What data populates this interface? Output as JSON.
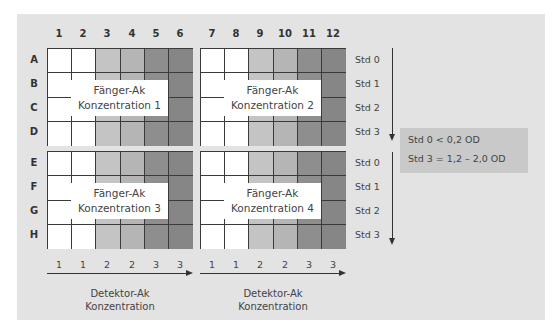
{
  "columns": [
    "1",
    "2",
    "3",
    "4",
    "5",
    "6",
    "7",
    "8",
    "9",
    "10",
    "11",
    "12"
  ],
  "rows_top": [
    "A",
    "B",
    "C",
    "D"
  ],
  "rows_bottom": [
    "E",
    "F",
    "G",
    "H"
  ],
  "colors": {
    "white": "#ffffff",
    "light": "#c4c4c4",
    "mid": "#b5b5b5",
    "dark": "#8e8e8e",
    "darker": "#868686",
    "panel": "#e3e3e3",
    "note": "#c9c9c9"
  },
  "plates": [
    {
      "title1": "Fänger-Ak",
      "title2": "Konzentration 1"
    },
    {
      "title1": "Fänger-Ak",
      "title2": "Konzentration 2"
    },
    {
      "title1": "Fänger-Ak",
      "title2": "Konzentration 3"
    },
    {
      "title1": "Fänger-Ak",
      "title2": "Konzentration 4"
    }
  ],
  "standards": [
    "Std 0",
    "Std 1",
    "Std 2",
    "Std 3"
  ],
  "detektor_levels": [
    "1",
    "1",
    "2",
    "2",
    "3",
    "3"
  ],
  "detektor_label": {
    "line1": "Detektor-Ak",
    "line2": "Konzentration"
  },
  "note": {
    "line1": "Std 0 < 0,2 OD",
    "line2": "Std 3 = 1,2 – 2,0 OD"
  }
}
